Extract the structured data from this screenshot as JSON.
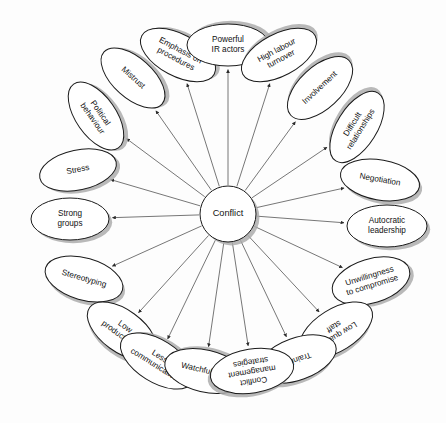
{
  "diagram": {
    "title": "Conflict",
    "type": "radial-mind-map",
    "center": {
      "label": "Conflict",
      "cx": 228,
      "cy": 214,
      "r": 28
    },
    "style": {
      "background": "#fdfdfd",
      "node_fill": "#ffffff",
      "node_stroke": "#1b1b1b",
      "shadow_color": "#a9a9a9",
      "line_color": "#4a4a4a",
      "text_color": "#111111"
    },
    "nodes": [
      {
        "label": "Emphasis on procedures",
        "lines": [
          "Emphasis on",
          "procedures"
        ],
        "cx": 178,
        "cy": 55,
        "rx": 21,
        "ry": 41,
        "rot": -62,
        "text_rot": 90
      },
      {
        "label": "Powerful IR actors",
        "lines": [
          "Powerful",
          "IR actors"
        ],
        "cx": 228,
        "cy": 45,
        "rx": 21,
        "ry": 41,
        "rot": -90,
        "text_rot": 90
      },
      {
        "label": "High labour turnover",
        "lines": [
          "High labour",
          "turnover"
        ],
        "cx": 279,
        "cy": 55,
        "rx": 21,
        "ry": 41,
        "rot": -118,
        "text_rot": 90
      },
      {
        "label": "Mistrust",
        "lines": [
          "Mistrust"
        ],
        "cx": 133,
        "cy": 78,
        "rx": 20,
        "ry": 39,
        "rot": -48,
        "text_rot": 90
      },
      {
        "label": "Involvement",
        "lines": [
          "Involvement"
        ],
        "cx": 320,
        "cy": 88,
        "rx": 21,
        "ry": 40,
        "rot": -133,
        "text_rot": 90
      },
      {
        "label": "Political behaviour",
        "lines": [
          "Political",
          "behaviour"
        ],
        "cx": 96,
        "cy": 116,
        "rx": 20,
        "ry": 39,
        "rot": -35,
        "text_rot": 90
      },
      {
        "label": "Difficult relationships",
        "lines": [
          "Difficult",
          "relationships"
        ],
        "cx": 357,
        "cy": 127,
        "rx": 20,
        "ry": 40,
        "rot": -148,
        "text_rot": 90
      },
      {
        "label": "Stress",
        "lines": [
          "Stress"
        ],
        "cx": 78,
        "cy": 170,
        "rx": 39,
        "ry": 20,
        "rot": -12,
        "text_rot": 0
      },
      {
        "label": "Negotiation",
        "lines": [
          "Negotiation"
        ],
        "cx": 380,
        "cy": 180,
        "rx": 40,
        "ry": 20,
        "rot": 10,
        "text_rot": 0
      },
      {
        "label": "Strong groups",
        "lines": [
          "Strong",
          "groups"
        ],
        "cx": 70,
        "cy": 219,
        "rx": 39,
        "ry": 21,
        "rot": 0,
        "text_rot": 0
      },
      {
        "label": "Autocratic leadership",
        "lines": [
          "Autocratic",
          "leadership"
        ],
        "cx": 387,
        "cy": 226,
        "rx": 40,
        "ry": 21,
        "rot": 0,
        "text_rot": 0
      },
      {
        "label": "Stereotyping",
        "lines": [
          "Stereotyping"
        ],
        "cx": 84,
        "cy": 279,
        "rx": 40,
        "ry": 21,
        "rot": 16,
        "text_rot": 0
      },
      {
        "label": "Unwillingness to compromise",
        "lines": [
          "Unwillingness",
          "to compromise"
        ],
        "cx": 371,
        "cy": 281,
        "rx": 40,
        "ry": 22,
        "rot": -17,
        "text_rot": 0
      },
      {
        "label": "Low productivity",
        "lines": [
          "Low",
          "productivity"
        ],
        "cx": 122,
        "cy": 331,
        "rx": 40,
        "ry": 21,
        "rot": 36,
        "text_rot": 0
      },
      {
        "label": "Low quality staff",
        "lines": [
          "Low quality",
          "staff"
        ],
        "cx": 336,
        "cy": 330,
        "rx": 21,
        "ry": 41,
        "rot": 58,
        "text_rot": 90
      },
      {
        "label": "Less communication",
        "lines": [
          "Less",
          "communication"
        ],
        "cx": 157,
        "cy": 361,
        "rx": 21,
        "ry": 41,
        "rot": -58,
        "text_rot": 90
      },
      {
        "label": "Training",
        "lines": [
          "Training"
        ],
        "cx": 297,
        "cy": 359,
        "rx": 21,
        "ry": 41,
        "rot": 70,
        "text_rot": 90
      },
      {
        "label": "Watchfulness",
        "lines": [
          "Watchfulness"
        ],
        "cx": 205,
        "cy": 371,
        "rx": 21,
        "ry": 41,
        "rot": -77,
        "text_rot": 90
      },
      {
        "label": "Conflict management strategies",
        "lines": [
          "Conflict",
          "management",
          "strategies"
        ],
        "cx": 252,
        "cy": 371,
        "rx": 22,
        "ry": 42,
        "rot": 81,
        "text_rot": 90
      }
    ]
  }
}
